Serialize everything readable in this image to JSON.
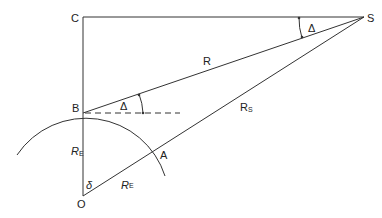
{
  "diagram": {
    "stroke_color": "#333333",
    "points": {
      "C": {
        "label": "C",
        "x": 83,
        "y": 17
      },
      "S": {
        "label": "S",
        "x": 364,
        "y": 17
      },
      "B": {
        "label": "B",
        "x": 83,
        "y": 113
      },
      "O": {
        "label": "O",
        "x": 83,
        "y": 196
      },
      "A": {
        "label": "A",
        "x": 154,
        "y": 153
      }
    },
    "labels": {
      "C": "C",
      "S": "S",
      "B": "B",
      "O": "O",
      "A": "A",
      "R": "R",
      "Rs_main": "R",
      "Rs_sub": "S",
      "RE_vertical_main": "R",
      "RE_vertical_sub": "E",
      "RE_slant_main": "R",
      "RE_slant_sub": "E",
      "delta_upper_S": "Δ",
      "delta_upper_B": "Δ",
      "delta_lower": "δ"
    },
    "segments": [
      {
        "name": "C-S",
        "from": "C",
        "to": "S"
      },
      {
        "name": "C-O",
        "from": "C",
        "to": "O"
      },
      {
        "name": "B-S",
        "from": "B",
        "to": "S"
      },
      {
        "name": "O-S",
        "from": "O",
        "to": "S"
      },
      {
        "name": "B-horizontal-dashed",
        "dashed": true
      }
    ]
  }
}
